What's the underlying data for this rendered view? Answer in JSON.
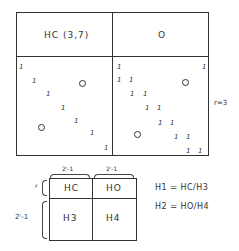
{
  "top_grid": {
    "header_left": "HC (3,7)",
    "header_right_symbol": "O",
    "side_label": "r=3",
    "left_cell": {
      "ones": [
        [
          19,
          64
        ],
        [
          32,
          78
        ],
        [
          46,
          91
        ],
        [
          61,
          105
        ],
        [
          74,
          118
        ],
        [
          90,
          130
        ],
        [
          104,
          145
        ]
      ],
      "circles": [
        [
          79,
          80
        ],
        [
          38,
          124
        ]
      ]
    },
    "right_cell": {
      "ones": [
        [
          117,
          64
        ],
        [
          202,
          64
        ],
        [
          117,
          77
        ],
        [
          129,
          77
        ],
        [
          130,
          91
        ],
        [
          143,
          91
        ],
        [
          145,
          105
        ],
        [
          157,
          105
        ],
        [
          158,
          120
        ],
        [
          170,
          120
        ],
        [
          174,
          134
        ],
        [
          186,
          134
        ],
        [
          186,
          148
        ],
        [
          198,
          148
        ]
      ],
      "circles": [
        [
          182,
          79
        ],
        [
          134,
          131
        ]
      ]
    }
  },
  "bottom_grid": {
    "brace_top_left": "2ʳ-1",
    "brace_top_right": "2ʳ-1",
    "brace_left_top": "r",
    "brace_left_bottom": "2ʳ-1",
    "cells": [
      "HC",
      "HO",
      "H3",
      "H4"
    ]
  },
  "equations": [
    "H1 = HC/H3",
    "H2 = HO/H4"
  ],
  "one_glyph": "1"
}
